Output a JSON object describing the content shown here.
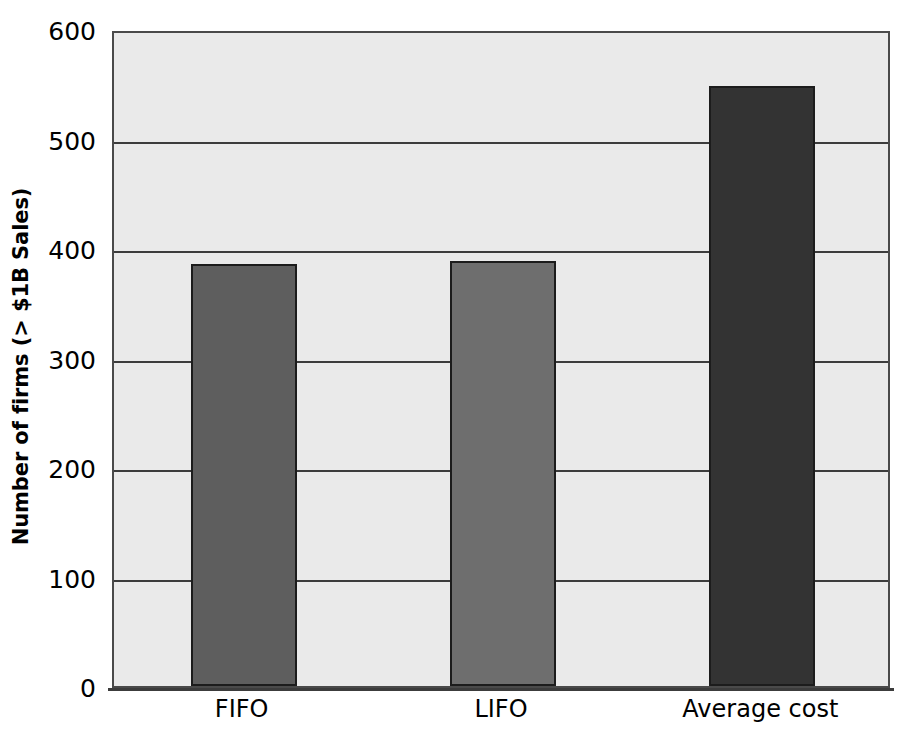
{
  "chart_data": {
    "type": "bar",
    "title": "",
    "xlabel": "",
    "ylabel": "Number of firms (> $1B Sales)",
    "categories": [
      "FIFO",
      "LIFO",
      "Average cost"
    ],
    "values": [
      385,
      388,
      548
    ],
    "series": [
      {
        "name": "Number of firms",
        "values": [
          385,
          388,
          548
        ]
      }
    ],
    "ylim": [
      0,
      600
    ],
    "yticks": [
      0,
      100,
      200,
      300,
      400,
      500,
      600
    ],
    "ytick_labels": [
      "0",
      "100",
      "200",
      "300",
      "400",
      "500",
      "600"
    ],
    "grid": true,
    "grid_axis": "y",
    "legend": false,
    "legend_position": "none",
    "bar_colors": [
      "#5e5e5e",
      "#6e6e6e",
      "#333333"
    ],
    "plot_background": "#eaeaea",
    "figure_background": "#ffffff",
    "axis_color": "#3c3c3c",
    "bar_edge_color": "#1c1c1c"
  }
}
